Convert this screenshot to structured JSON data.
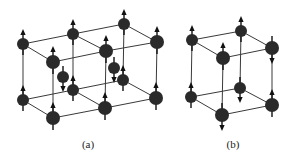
{
  "figure": {
    "colors": {
      "atom": "#2a2a2a",
      "line": "#3a3a3a",
      "background": "#ffffff",
      "label": "#222222"
    },
    "panels": [
      {
        "label": "(a)",
        "label_pos": [
          88,
          147
        ],
        "atoms": [
          {
            "x": 23,
            "y": 44,
            "r": 6,
            "spin": "up"
          },
          {
            "x": 73,
            "y": 34,
            "r": 6,
            "spin": "up"
          },
          {
            "x": 124,
            "y": 24,
            "r": 6,
            "spin": "up"
          },
          {
            "x": 53,
            "y": 62,
            "r": 7,
            "spin": "up"
          },
          {
            "x": 106,
            "y": 51,
            "r": 7,
            "spin": "up"
          },
          {
            "x": 157,
            "y": 42,
            "r": 7,
            "spin": "up"
          },
          {
            "x": 63,
            "y": 77,
            "r": 6,
            "spin": "down"
          },
          {
            "x": 114,
            "y": 68,
            "r": 6,
            "spin": "down"
          },
          {
            "x": 23,
            "y": 100,
            "r": 6,
            "spin": "up"
          },
          {
            "x": 73,
            "y": 90,
            "r": 6,
            "spin": "up"
          },
          {
            "x": 123,
            "y": 80,
            "r": 6,
            "spin": "up"
          },
          {
            "x": 53,
            "y": 118,
            "r": 7,
            "spin": "up"
          },
          {
            "x": 105,
            "y": 108,
            "r": 7,
            "spin": "up"
          },
          {
            "x": 156,
            "y": 98,
            "r": 7,
            "spin": "up"
          }
        ],
        "bonds": [
          [
            0,
            1
          ],
          [
            1,
            2
          ],
          [
            3,
            4
          ],
          [
            4,
            5
          ],
          [
            0,
            3
          ],
          [
            1,
            4
          ],
          [
            2,
            5
          ],
          [
            8,
            9
          ],
          [
            9,
            10
          ],
          [
            11,
            12
          ],
          [
            12,
            13
          ],
          [
            8,
            11
          ],
          [
            9,
            12
          ],
          [
            10,
            13
          ],
          [
            0,
            8
          ],
          [
            1,
            9
          ],
          [
            2,
            10
          ],
          [
            3,
            11
          ],
          [
            4,
            12
          ],
          [
            5,
            13
          ]
        ]
      },
      {
        "label": "(b)",
        "label_pos": [
          233,
          147
        ],
        "atoms": [
          {
            "x": 192,
            "y": 40,
            "r": 6,
            "spin": "up"
          },
          {
            "x": 241,
            "y": 31,
            "r": 6,
            "spin": "up"
          },
          {
            "x": 223,
            "y": 58,
            "r": 7,
            "spin": "up"
          },
          {
            "x": 272,
            "y": 48,
            "r": 7,
            "spin": "down"
          },
          {
            "x": 191,
            "y": 97,
            "r": 6,
            "spin": "up"
          },
          {
            "x": 240,
            "y": 88,
            "r": 6,
            "spin": "down"
          },
          {
            "x": 222,
            "y": 115,
            "r": 7,
            "spin": "down"
          },
          {
            "x": 272,
            "y": 105,
            "r": 7,
            "spin": "up"
          }
        ],
        "bonds": [
          [
            0,
            1
          ],
          [
            2,
            3
          ],
          [
            0,
            2
          ],
          [
            1,
            3
          ],
          [
            4,
            5
          ],
          [
            6,
            7
          ],
          [
            4,
            6
          ],
          [
            5,
            7
          ],
          [
            0,
            4
          ],
          [
            1,
            5
          ],
          [
            2,
            6
          ],
          [
            3,
            7
          ]
        ]
      }
    ]
  }
}
